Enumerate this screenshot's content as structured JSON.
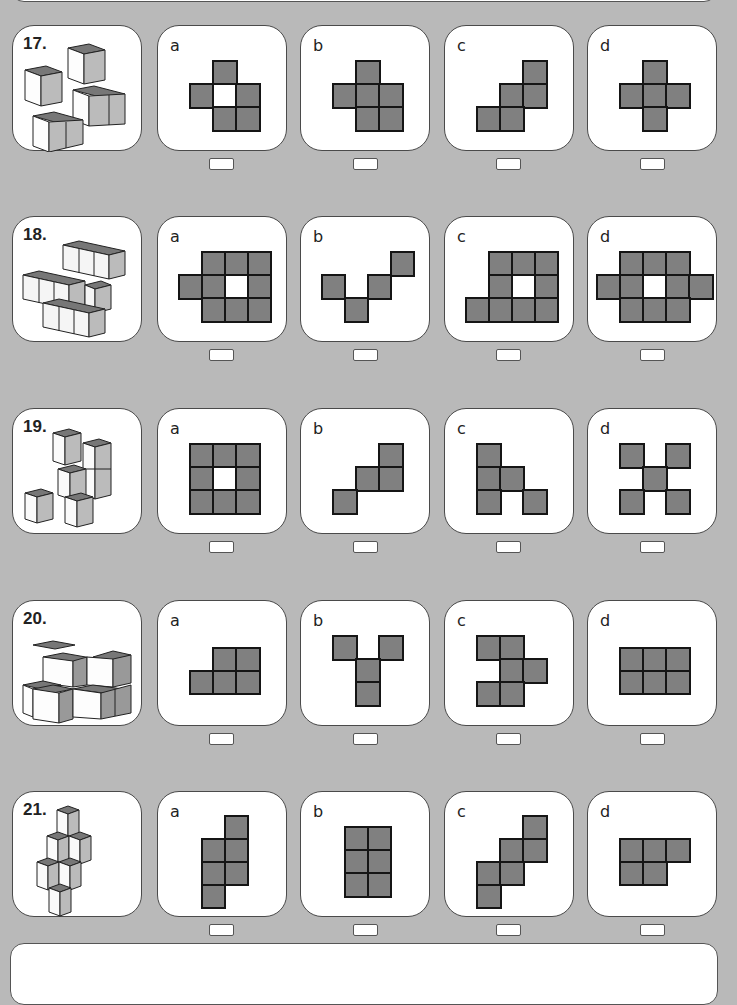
{
  "page": {
    "background_color": "#b9b9b9",
    "cell_fill_color": "#808080",
    "cell_border_color": "#151515"
  },
  "questions": [
    {
      "number": "17.",
      "options": [
        {
          "letter": "a",
          "grid": [
            [
              0,
              1,
              0
            ],
            [
              1,
              2,
              1
            ],
            [
              0,
              1,
              1
            ]
          ]
        },
        {
          "letter": "b",
          "grid": [
            [
              0,
              1,
              0
            ],
            [
              1,
              1,
              1
            ],
            [
              0,
              1,
              1
            ]
          ]
        },
        {
          "letter": "c",
          "grid": [
            [
              0,
              0,
              1
            ],
            [
              0,
              1,
              1
            ],
            [
              1,
              1,
              0
            ]
          ]
        },
        {
          "letter": "d",
          "grid": [
            [
              0,
              1,
              0
            ],
            [
              1,
              1,
              1
            ],
            [
              0,
              1,
              0
            ]
          ]
        }
      ]
    },
    {
      "number": "18.",
      "options": [
        {
          "letter": "a",
          "grid": [
            [
              0,
              1,
              1,
              1
            ],
            [
              1,
              1,
              2,
              1
            ],
            [
              0,
              1,
              1,
              1
            ]
          ]
        },
        {
          "letter": "b",
          "grid": [
            [
              0,
              0,
              0,
              1
            ],
            [
              1,
              0,
              1,
              0
            ],
            [
              0,
              1,
              0,
              0
            ]
          ]
        },
        {
          "letter": "c",
          "grid": [
            [
              0,
              1,
              1,
              1
            ],
            [
              0,
              1,
              2,
              1
            ],
            [
              1,
              1,
              1,
              1
            ]
          ]
        },
        {
          "letter": "d",
          "grid": [
            [
              0,
              1,
              1,
              1,
              0
            ],
            [
              1,
              1,
              2,
              1,
              1
            ],
            [
              0,
              1,
              1,
              1,
              0
            ]
          ]
        }
      ]
    },
    {
      "number": "19.",
      "options": [
        {
          "letter": "a",
          "grid": [
            [
              1,
              1,
              1
            ],
            [
              1,
              2,
              1
            ],
            [
              1,
              1,
              1
            ]
          ]
        },
        {
          "letter": "b",
          "grid": [
            [
              0,
              0,
              1
            ],
            [
              0,
              1,
              1
            ],
            [
              1,
              0,
              0
            ]
          ]
        },
        {
          "letter": "c",
          "grid": [
            [
              1,
              0,
              0
            ],
            [
              1,
              1,
              0
            ],
            [
              1,
              0,
              1
            ]
          ]
        },
        {
          "letter": "d",
          "grid": [
            [
              1,
              0,
              1
            ],
            [
              0,
              1,
              0
            ],
            [
              1,
              0,
              1
            ]
          ]
        }
      ]
    },
    {
      "number": "20.",
      "options": [
        {
          "letter": "a",
          "grid": [
            [
              0,
              1,
              1
            ],
            [
              1,
              1,
              1
            ]
          ]
        },
        {
          "letter": "b",
          "grid": [
            [
              1,
              0,
              1
            ],
            [
              0,
              1,
              0
            ],
            [
              0,
              1,
              0
            ]
          ]
        },
        {
          "letter": "c",
          "grid": [
            [
              1,
              1,
              0
            ],
            [
              0,
              1,
              1
            ],
            [
              1,
              1,
              0
            ]
          ]
        },
        {
          "letter": "d",
          "grid": [
            [
              1,
              1,
              1
            ],
            [
              1,
              1,
              1
            ]
          ]
        }
      ]
    },
    {
      "number": "21.",
      "options": [
        {
          "letter": "a",
          "grid": [
            [
              0,
              1
            ],
            [
              1,
              1
            ],
            [
              1,
              1
            ],
            [
              1,
              0
            ]
          ]
        },
        {
          "letter": "b",
          "grid": [
            [
              1,
              1
            ],
            [
              1,
              1
            ],
            [
              1,
              1
            ]
          ]
        },
        {
          "letter": "c",
          "grid": [
            [
              0,
              0,
              1
            ],
            [
              0,
              1,
              1
            ],
            [
              1,
              1,
              0
            ],
            [
              1,
              0,
              0
            ]
          ]
        },
        {
          "letter": "d",
          "grid": [
            [
              1,
              1,
              1
            ],
            [
              1,
              1,
              0
            ]
          ]
        }
      ]
    }
  ]
}
